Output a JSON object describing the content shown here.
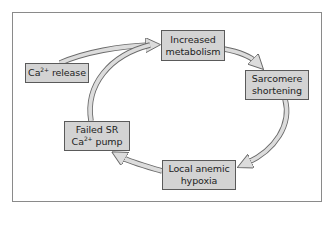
{
  "diagram": {
    "type": "cycle",
    "nodes": [
      {
        "id": "ca_release",
        "lines": [
          "Ca",
          "2+",
          " release"
        ]
      },
      {
        "id": "increased_metabolism",
        "lines": [
          "Increased",
          "metabolism"
        ]
      },
      {
        "id": "sarcomere_shortening",
        "lines": [
          "Sarcomere",
          "shortening"
        ]
      },
      {
        "id": "local_anemic_hypoxia",
        "lines": [
          "Local anemic",
          "hypoxia"
        ]
      },
      {
        "id": "failed_sr_pump",
        "line1": "Failed SR",
        "line2_base": "Ca",
        "line2_sup": "2+",
        "line2_rest": " pump"
      }
    ],
    "ca_release": {
      "base": "Ca",
      "sup": "2+",
      "rest": " release"
    },
    "increased_metabolism": {
      "line1": "Increased",
      "line2": "metabolism"
    },
    "sarcomere_shortening": {
      "line1": "Sarcomere",
      "line2": "shortening"
    },
    "local_anemic_hypoxia": {
      "line1": "Local anemic",
      "line2": "hypoxia"
    },
    "failed_sr_pump": {
      "line1": "Failed SR",
      "line2_base": "Ca",
      "line2_sup": "2+",
      "line2_rest": " pump"
    },
    "edges": [
      {
        "from": "Ca2+ release",
        "to": "Increased metabolism"
      },
      {
        "from": "Increased metabolism",
        "to": "Sarcomere shortening"
      },
      {
        "from": "Sarcomere shortening",
        "to": "Local anemic hypoxia"
      },
      {
        "from": "Local anemic hypoxia",
        "to": "Failed SR Ca2+ pump"
      },
      {
        "from": "Failed SR Ca2+ pump",
        "to": "Increased metabolism"
      }
    ],
    "colors": {
      "box_fill": "#d3d3d3",
      "box_border": "#5a5a5a",
      "arrow_fill": "#dcdcdc",
      "arrow_stroke": "#6a6a6a",
      "frame": "#8a8a8a",
      "text": "#222222"
    }
  }
}
